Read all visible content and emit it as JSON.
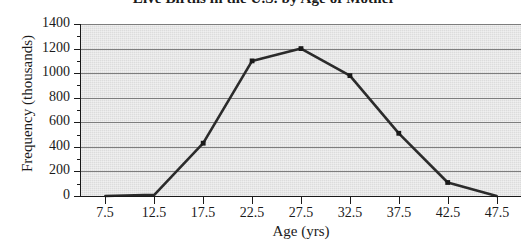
{
  "chart_data": {
    "type": "line",
    "title": "Live Births in the U.S. by Age of Mother",
    "xlabel": "Age (yrs)",
    "ylabel": "Frequency (thousands)",
    "x": [
      7.5,
      12.5,
      17.5,
      22.5,
      27.5,
      32.5,
      37.5,
      42.5,
      47.5
    ],
    "values": [
      0,
      10,
      430,
      1100,
      1200,
      980,
      510,
      110,
      0
    ],
    "categories": [
      "7.5",
      "12.5",
      "17.5",
      "22.5",
      "27.5",
      "32.5",
      "37.5",
      "42.5",
      "47.5"
    ],
    "xtick_labels": [
      "7.5",
      "12.5",
      "17.5",
      "22.5",
      "27.5",
      "32.5",
      "37.5",
      "42.5",
      "47.5"
    ],
    "ytick_labels": [
      "0",
      "200",
      "400",
      "600",
      "800",
      "1000",
      "1200",
      "1400"
    ],
    "ytick_values": [
      0,
      200,
      400,
      600,
      800,
      1000,
      1200,
      1400
    ],
    "xlim": [
      5.0,
      50.0
    ],
    "ylim": [
      0,
      1400
    ],
    "grid": true,
    "legend": false,
    "series": [
      {
        "name": "Live births",
        "values": [
          0,
          10,
          430,
          1100,
          1200,
          980,
          510,
          110,
          0
        ]
      }
    ],
    "colors": {
      "line": "#2b2b2b",
      "marker": "#1a1a1a",
      "plot_background": "#dcdcdc",
      "gridline": "#7d7d7d",
      "axis": "#1a1a1a",
      "page_background": "#ffffff"
    }
  }
}
